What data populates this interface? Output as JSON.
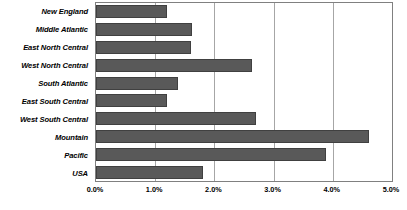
{
  "chart_data": {
    "type": "bar",
    "orientation": "horizontal",
    "title": "",
    "subtitle": "",
    "xlabel": "",
    "ylabel": "",
    "categories": [
      "New England",
      "Middle Atlantic",
      "East North Central",
      "West North Central",
      "South Atlantic",
      "East South Central",
      "West South Central",
      "Mountain",
      "Pacific",
      "USA"
    ],
    "values": [
      1.2,
      1.62,
      1.6,
      2.63,
      1.38,
      1.2,
      2.71,
      4.61,
      3.89,
      1.8
    ],
    "value_unit": "%",
    "xlim": [
      0.0,
      5.0
    ],
    "xticks": [
      0.0,
      1.0,
      2.0,
      3.0,
      4.0,
      5.0
    ],
    "xtick_labels": [
      "0.0%",
      "1.0%",
      "2.0%",
      "3.0%",
      "4.0%",
      "5.0%"
    ],
    "grid": "vertical",
    "legend": "none",
    "series": [
      {
        "name": "",
        "values": [
          1.2,
          1.62,
          1.6,
          2.63,
          1.38,
          1.2,
          2.71,
          4.61,
          3.89,
          1.8
        ]
      }
    ],
    "colors": {
      "bar_fill": "#595959",
      "bar_border": "#404040",
      "gridline": "#a6a6a6",
      "plot_border": "#808080",
      "background": "#ffffff",
      "text": "#000000"
    }
  }
}
